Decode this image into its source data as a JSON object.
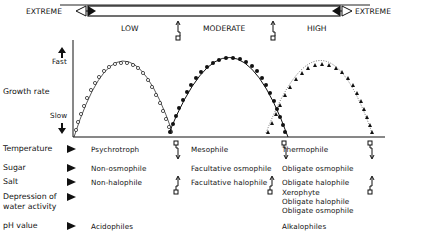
{
  "scale": {
    "left_label": "EXTREME",
    "right_label": "EXTREME",
    "levels": [
      "LOW",
      "MODERATE",
      "HIGH"
    ]
  },
  "axis": {
    "title": "Growth rate",
    "top_label": "Fast",
    "bottom_label": "Slow"
  },
  "curves": [
    {
      "name": "low",
      "marker": "open-circle",
      "color": "#111111"
    },
    {
      "name": "moderate",
      "marker": "filled-circle",
      "color": "#111111"
    },
    {
      "name": "high",
      "marker": "filled-triangle",
      "color": "#111111"
    }
  ],
  "rows": [
    {
      "factor": "Temperature",
      "low": "Psychrotroph",
      "moderate": "Mesophile",
      "high": "Thermophile"
    },
    {
      "factor": "Sugar",
      "low": "Non-osmophile",
      "moderate": "Facultative osmophile",
      "high": "Obligate osmophile"
    },
    {
      "factor": "Salt",
      "low": "Non-halophile",
      "moderate": "Facultative halophile",
      "high": "Obligate halophile"
    },
    {
      "factor": "Depression of",
      "factor2": "water activity",
      "low": "",
      "moderate": "",
      "high": "Xerophyte",
      "high2": "Obligate halophile",
      "high3": "Obligate osmophile"
    },
    {
      "factor": "pH value",
      "low": "Acidophiles",
      "moderate": "",
      "high": "Alkalophiles"
    }
  ]
}
